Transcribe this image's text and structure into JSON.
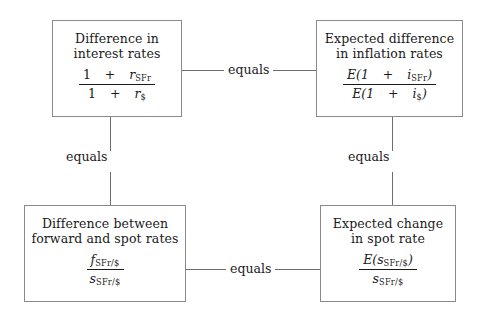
{
  "diagram": {
    "boxes": {
      "interest_rates": {
        "heading": "Difference in\ninterest rates",
        "numerator_prefix": "1",
        "numerator_op": "+",
        "numerator_var": "r",
        "numerator_sub": "SFr",
        "denominator_prefix": "1",
        "denominator_op": "+",
        "denominator_var": "r",
        "denominator_sub": "$"
      },
      "inflation_rates": {
        "heading": "Expected difference\nin inflation rates",
        "numerator_prefix": "E(1",
        "numerator_op": "+",
        "numerator_var": "i",
        "numerator_sub": "SFr",
        "numerator_suffix": ")",
        "denominator_prefix": "E(1",
        "denominator_op": "+",
        "denominator_var": "i",
        "denominator_sub": "$",
        "denominator_suffix": ")"
      },
      "forward_spot": {
        "heading": "Difference between\nforward and spot rates",
        "numerator_var": "f",
        "numerator_sub": "SFr/$",
        "denominator_var": "s",
        "denominator_sub": "SFr/$"
      },
      "spot_change": {
        "heading": "Expected change\nin spot rate",
        "numerator_prefix": "E(",
        "numerator_var": "s",
        "numerator_sub": "SFr/$",
        "numerator_suffix": ")",
        "denominator_var": "s",
        "denominator_sub": "SFr/$"
      }
    },
    "connectors": {
      "top": "equals",
      "left": "equals",
      "right": "equals",
      "bottom": "equals"
    },
    "colors": {
      "box_border": "#8a8a8a",
      "connector_line": "#6f6f6f",
      "text": "#1a1a1a",
      "background": "#ffffff"
    }
  }
}
